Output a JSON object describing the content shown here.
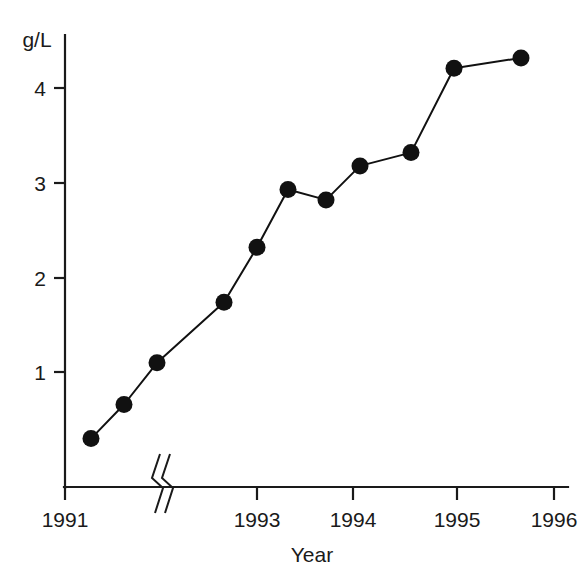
{
  "chart_data": {
    "type": "line",
    "title": "",
    "subtitle": "",
    "xlabel": "Year",
    "ylabel": "g/L",
    "y_unit_label": "g/L",
    "grid": false,
    "legend": false,
    "axis_break": true,
    "axis_break_note": "x-axis break between 1991 and 1993",
    "marker": "filled-circle",
    "ylim": [
      0,
      4.6
    ],
    "yticks": [
      1,
      2,
      3,
      4
    ],
    "ytick_labels": [
      "1",
      "2",
      "3",
      "4"
    ],
    "xticks": [
      1991,
      1993,
      1994,
      1995,
      1996
    ],
    "xtick_labels": [
      "1991",
      "1993",
      "1994",
      "1995",
      "1996"
    ],
    "series": [
      {
        "name": "g/L",
        "x": [
          1991.3,
          1991.65,
          1992.0,
          1992.7,
          1993.05,
          1993.37,
          1993.77,
          1994.07,
          1994.6,
          1995.07,
          1995.77
        ],
        "values": [
          0.3,
          0.66,
          1.1,
          1.74,
          2.32,
          2.93,
          2.82,
          3.18,
          3.32,
          4.21,
          4.32
        ],
        "px": [
          91,
          124,
          157,
          224,
          257,
          288,
          326,
          360,
          411,
          454,
          521
        ]
      }
    ]
  },
  "axes": {
    "y_axis_top_px": 35,
    "y_axis_bottom_px": 487,
    "x_axis_left_px": 65,
    "x_axis_right_px": 568,
    "y_value_to_px": {
      "v0": 467,
      "px_per_unit": 94.7
    },
    "xtick_px": [
      65,
      257,
      353,
      457,
      554
    ],
    "break_px": 158
  },
  "labels": {
    "unit": "g/L",
    "axis_title_x": "Year",
    "y_ticks": [
      "4",
      "3",
      "2",
      "1"
    ],
    "x_ticks": [
      "1991",
      "1993",
      "1994",
      "1995",
      "1996"
    ]
  },
  "colors": {
    "background": "#ffffff",
    "ink": "#1a1a1a",
    "series": "#111111"
  }
}
